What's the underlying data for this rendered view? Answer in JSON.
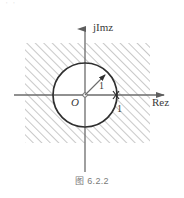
{
  "figure": {
    "caption": "图 6.2.2",
    "top_artifact": "' '",
    "axes": {
      "vertical_label": "jImz",
      "horizontal_label": "Rez",
      "origin_label": "O"
    },
    "annotations": {
      "radius_label": "1",
      "real_axis_tick_label": "1"
    },
    "colors": {
      "stroke": "#3a3a3a",
      "axis": "#6b6b6b",
      "hatch": "#9a9a9a",
      "caption": "#7a7a7a",
      "background": "#ffffff"
    },
    "geometry": {
      "circle_center_x": 85,
      "circle_center_y": 95,
      "circle_radius": 32,
      "hatch_left": 25,
      "hatch_top": 43,
      "hatch_right": 150,
      "hatch_bottom": 143,
      "hatch_angle_deg": 45
    }
  }
}
